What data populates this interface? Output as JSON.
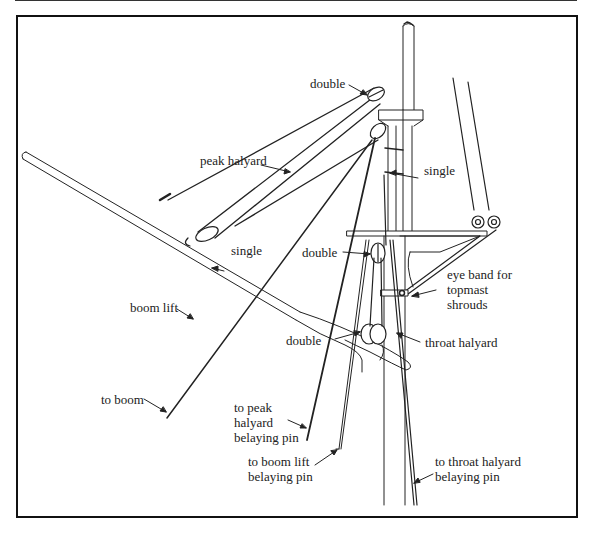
{
  "diagram": {
    "labels": {
      "double_top": "double",
      "peak_halyard": "peak halyard",
      "single_mast": "single",
      "single_gaff": "single",
      "double_mid": "double",
      "eye_band": "eye band for\ntopmast\nshrouds",
      "boom_lift": "boom lift",
      "double_low": "double",
      "throat_halyard": "throat halyard",
      "to_boom": "to boom",
      "to_peak_pin": "to peak\nhalyard\nbelaying pin",
      "to_boom_lift_pin": "to boom lift\nbelaying pin",
      "to_throat_pin": "to throat halyard\nbelaying pin"
    },
    "colors": {
      "line": "#222222",
      "frame": "#111111",
      "background": "#ffffff"
    }
  }
}
